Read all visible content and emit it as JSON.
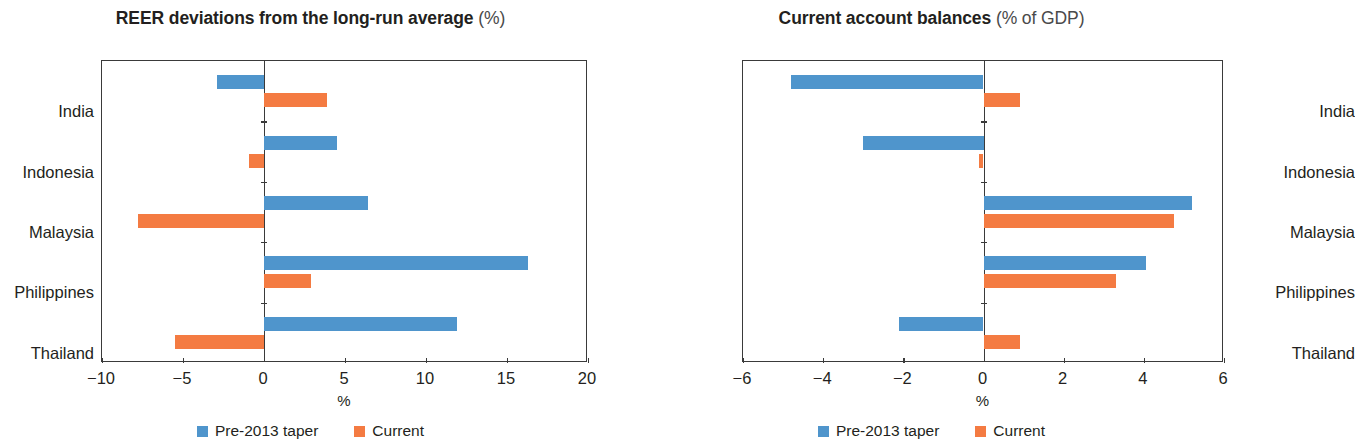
{
  "panels": [
    {
      "title_main": "REER deviations from the long-run average",
      "title_sub": "(%)",
      "xaxis_label": "%",
      "legend": [
        {
          "label": "Pre-2013 taper",
          "color": "#4f95cc",
          "icon": "legend-square-blue"
        },
        {
          "label": "Current",
          "color": "#f47b42",
          "icon": "legend-square-orange"
        }
      ]
    },
    {
      "title_main": "Current account balances",
      "title_sub": "(% of GDP)",
      "xaxis_label": "%",
      "legend": [
        {
          "label": "Pre-2013 taper",
          "color": "#4f95cc",
          "icon": "legend-square-blue"
        },
        {
          "label": "Current",
          "color": "#f47b42",
          "icon": "legend-square-orange"
        }
      ]
    }
  ],
  "chart_data": [
    {
      "type": "bar",
      "orientation": "horizontal",
      "title": "REER deviations from the long-run average (%)",
      "xlabel": "%",
      "ylabel": "",
      "xlim": [
        -10,
        20
      ],
      "xticks": [
        -10,
        -5,
        0,
        5,
        10,
        15,
        20
      ],
      "xticklabels": [
        "−10",
        "−5",
        "0",
        "5",
        "10",
        "15",
        "20"
      ],
      "categories": [
        "India",
        "Indonesia",
        "Malaysia",
        "Philippines",
        "Thailand"
      ],
      "grid": false,
      "legend_position": "bottom",
      "series": [
        {
          "name": "Pre-2013 taper",
          "color": "#4f95cc",
          "values": [
            -2.9,
            4.5,
            6.4,
            16.3,
            11.9
          ]
        },
        {
          "name": "Current",
          "color": "#f47b42",
          "values": [
            3.9,
            -0.9,
            -7.8,
            2.9,
            -5.5
          ]
        }
      ]
    },
    {
      "type": "bar",
      "orientation": "horizontal",
      "title": "Current account balances (% of GDP)",
      "xlabel": "%",
      "ylabel": "",
      "xlim": [
        -6,
        6
      ],
      "xticks": [
        -6,
        -4,
        -2,
        0,
        2,
        4,
        6
      ],
      "xticklabels": [
        "−6",
        "−4",
        "−2",
        "0",
        "2",
        "4",
        "6"
      ],
      "categories": [
        "India",
        "Indonesia",
        "Malaysia",
        "Philippines",
        "Thailand"
      ],
      "grid": false,
      "legend_position": "bottom",
      "series": [
        {
          "name": "Pre-2013 taper",
          "color": "#4f95cc",
          "values": [
            -4.8,
            -3.0,
            5.2,
            4.05,
            -2.1
          ]
        },
        {
          "name": "Current",
          "color": "#f47b42",
          "values": [
            0.9,
            -0.1,
            4.75,
            3.3,
            0.9
          ]
        }
      ]
    }
  ]
}
